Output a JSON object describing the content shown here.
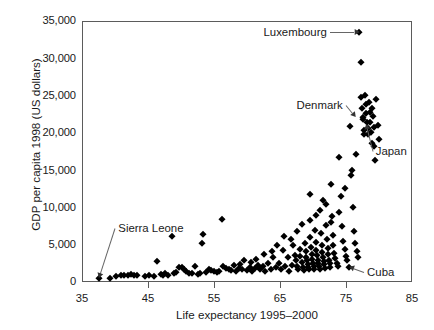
{
  "chart_data": {
    "type": "scatter",
    "title": "",
    "xlabel": "Life expectancy 1995–2000",
    "ylabel": "GDP per capita 1998 (US dollars)",
    "xlim": [
      35,
      85
    ],
    "ylim": [
      0,
      35000
    ],
    "xticks": [
      35,
      45,
      55,
      65,
      75,
      85
    ],
    "xtick_labels": [
      "35",
      "45",
      "55",
      "65",
      "75",
      "85"
    ],
    "yticks": [
      0,
      5000,
      10000,
      15000,
      20000,
      25000,
      30000,
      35000
    ],
    "ytick_labels": [
      "0",
      "5,000",
      "10,000",
      "15,000",
      "20,000",
      "25,000",
      "30,000",
      "35,000"
    ],
    "grid": false,
    "legend": null,
    "marker": "diamond",
    "marker_color": "#000000",
    "annotations": [
      {
        "label": "Luxembourg",
        "x": 77.0,
        "y": 33500,
        "text_x": 62.5,
        "text_y": 33500
      },
      {
        "label": "Denmark",
        "x": 76.4,
        "y": 22200,
        "text_x": 67.5,
        "text_y": 23800
      },
      {
        "label": "Japan",
        "x": 78.0,
        "y": 21200,
        "text_x": 79.5,
        "text_y": 17600
      },
      {
        "label": "Sierra Leone",
        "x": 37.6,
        "y": 500,
        "text_x": 40.5,
        "text_y": 7200
      },
      {
        "label": "Cuba",
        "x": 75.5,
        "y": 2050,
        "text_x": 78.2,
        "text_y": 1350
      }
    ],
    "points": [
      [
        37.6,
        500
      ],
      [
        39.3,
        600
      ],
      [
        40.2,
        850
      ],
      [
        40.9,
        900
      ],
      [
        41.4,
        1000
      ],
      [
        41.9,
        950
      ],
      [
        42.4,
        1050
      ],
      [
        42.9,
        900
      ],
      [
        43.4,
        980
      ],
      [
        44.6,
        800
      ],
      [
        45.1,
        880
      ],
      [
        45.9,
        820
      ],
      [
        46.4,
        2750
      ],
      [
        46.9,
        1050
      ],
      [
        47.2,
        900
      ],
      [
        47.6,
        1150
      ],
      [
        48.1,
        1000
      ],
      [
        48.6,
        6200
      ],
      [
        48.9,
        1250
      ],
      [
        49.3,
        1400
      ],
      [
        49.7,
        2050
      ],
      [
        50.1,
        2000
      ],
      [
        50.4,
        1700
      ],
      [
        50.8,
        1500
      ],
      [
        51.2,
        1250
      ],
      [
        51.7,
        1150
      ],
      [
        52.1,
        2100
      ],
      [
        52.5,
        1100
      ],
      [
        52.9,
        1200
      ],
      [
        53.2,
        5200
      ],
      [
        53.4,
        6500
      ],
      [
        53.8,
        1350
      ],
      [
        54.2,
        1750
      ],
      [
        54.6,
        1600
      ],
      [
        55.0,
        1500
      ],
      [
        55.4,
        1400
      ],
      [
        55.8,
        1450
      ],
      [
        56.2,
        8500
      ],
      [
        56.4,
        2100
      ],
      [
        56.8,
        1900
      ],
      [
        57.2,
        1750
      ],
      [
        57.6,
        1600
      ],
      [
        58.0,
        2250
      ],
      [
        58.4,
        1500
      ],
      [
        58.8,
        1850
      ],
      [
        59.2,
        1700
      ],
      [
        59.6,
        3000
      ],
      [
        60.0,
        1600
      ],
      [
        60.4,
        2000
      ],
      [
        60.8,
        1450
      ],
      [
        61.2,
        1900
      ],
      [
        61.6,
        2300
      ],
      [
        62.0,
        1700
      ],
      [
        62.4,
        2100
      ],
      [
        62.8,
        1500
      ],
      [
        63.2,
        2600
      ],
      [
        63.6,
        1800
      ],
      [
        64.0,
        3400
      ],
      [
        64.4,
        2000
      ],
      [
        64.8,
        2600
      ],
      [
        65.2,
        1700
      ],
      [
        65.4,
        4300
      ],
      [
        65.8,
        2100
      ],
      [
        66.2,
        3300
      ],
      [
        66.4,
        1500
      ],
      [
        66.8,
        2300
      ],
      [
        67.0,
        5000
      ],
      [
        67.2,
        3600
      ],
      [
        67.4,
        2900
      ],
      [
        67.6,
        2150
      ],
      [
        67.8,
        1800
      ],
      [
        68.0,
        4400
      ],
      [
        68.1,
        3500
      ],
      [
        68.3,
        2700
      ],
      [
        68.5,
        2000
      ],
      [
        68.6,
        1600
      ],
      [
        68.8,
        5200
      ],
      [
        68.9,
        4100
      ],
      [
        69.0,
        3400
      ],
      [
        69.1,
        2900
      ],
      [
        69.2,
        2400
      ],
      [
        69.3,
        2000
      ],
      [
        69.4,
        1700
      ],
      [
        69.5,
        8300
      ],
      [
        69.6,
        6100
      ],
      [
        69.7,
        4700
      ],
      [
        69.8,
        3800
      ],
      [
        69.9,
        3100
      ],
      [
        70.0,
        2600
      ],
      [
        70.1,
        2200
      ],
      [
        70.2,
        1800
      ],
      [
        70.3,
        7000
      ],
      [
        70.4,
        5400
      ],
      [
        70.5,
        4300
      ],
      [
        70.6,
        3600
      ],
      [
        70.7,
        3000
      ],
      [
        70.8,
        2500
      ],
      [
        70.9,
        2100
      ],
      [
        71.0,
        1750
      ],
      [
        71.1,
        9600
      ],
      [
        71.2,
        6600
      ],
      [
        71.3,
        5000
      ],
      [
        71.4,
        4000
      ],
      [
        71.5,
        3300
      ],
      [
        71.6,
        2800
      ],
      [
        71.7,
        2350
      ],
      [
        71.8,
        1900
      ],
      [
        71.9,
        10500
      ],
      [
        72.0,
        7600
      ],
      [
        72.1,
        5700
      ],
      [
        72.2,
        4500
      ],
      [
        72.3,
        3700
      ],
      [
        72.4,
        3000
      ],
      [
        72.5,
        2500
      ],
      [
        72.6,
        2050
      ],
      [
        72.8,
        13200
      ],
      [
        72.9,
        8800
      ],
      [
        73.0,
        6300
      ],
      [
        73.1,
        4900
      ],
      [
        73.2,
        3900
      ],
      [
        73.4,
        3200
      ],
      [
        73.6,
        2600
      ],
      [
        73.8,
        2200
      ],
      [
        74.0,
        16800
      ],
      [
        74.2,
        11500
      ],
      [
        74.4,
        7500
      ],
      [
        74.6,
        5500
      ],
      [
        74.8,
        4400
      ],
      [
        75.0,
        3500
      ],
      [
        75.2,
        2900
      ],
      [
        75.5,
        2050
      ],
      [
        75.6,
        20900
      ],
      [
        75.8,
        14300
      ],
      [
        76.0,
        10000
      ],
      [
        76.2,
        6800
      ],
      [
        76.4,
        5200
      ],
      [
        76.6,
        4200
      ],
      [
        76.8,
        3400
      ],
      [
        77.0,
        33500
      ],
      [
        77.2,
        29500
      ],
      [
        77.3,
        24800
      ],
      [
        77.4,
        23300
      ],
      [
        77.5,
        22100
      ],
      [
        77.6,
        21800
      ],
      [
        77.7,
        20400
      ],
      [
        77.8,
        19800
      ],
      [
        77.9,
        25100
      ],
      [
        78.0,
        23900
      ],
      [
        78.1,
        22600
      ],
      [
        78.2,
        21400
      ],
      [
        78.3,
        20700
      ],
      [
        78.4,
        19900
      ],
      [
        78.5,
        24100
      ],
      [
        78.6,
        22800
      ],
      [
        78.7,
        21500
      ],
      [
        78.8,
        20100
      ],
      [
        78.9,
        18600
      ],
      [
        79.0,
        23400
      ],
      [
        79.1,
        22200
      ],
      [
        79.2,
        20800
      ],
      [
        79.3,
        18200
      ],
      [
        79.4,
        16400
      ],
      [
        79.6,
        24600
      ],
      [
        79.8,
        21000
      ],
      [
        80.0,
        19200
      ],
      [
        76.5,
        17200
      ],
      [
        75.9,
        15000
      ],
      [
        74.9,
        12600
      ],
      [
        73.9,
        9400
      ],
      [
        72.7,
        8000
      ],
      [
        71.5,
        11000
      ],
      [
        70.5,
        9000
      ],
      [
        69.5,
        11800
      ],
      [
        68.4,
        7800
      ],
      [
        67.5,
        6800
      ],
      [
        66.6,
        5700
      ],
      [
        65.6,
        6200
      ],
      [
        64.6,
        4900
      ],
      [
        63.8,
        4100
      ],
      [
        62.6,
        3800
      ],
      [
        61.4,
        3100
      ],
      [
        60.6,
        2700
      ],
      [
        59.0,
        2400
      ]
    ]
  }
}
